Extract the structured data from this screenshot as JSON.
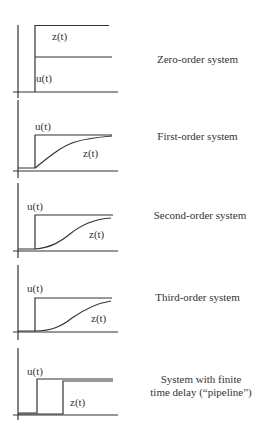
{
  "figure": {
    "panels": [
      {
        "id": "zero-order",
        "title": "Zero-order system",
        "u_label": "u(t)",
        "z_label": "z(t)"
      },
      {
        "id": "first-order",
        "title": "First-order system",
        "u_label": "u(t)",
        "z_label": "z(t)"
      },
      {
        "id": "second-order",
        "title": "Second-order system",
        "u_label": "u(t)",
        "z_label": "z(t)"
      },
      {
        "id": "third-order",
        "title": "Third-order system",
        "u_label": "u(t)",
        "z_label": "z(t)"
      },
      {
        "id": "pipeline",
        "title_line1": "System with finite",
        "title_line2": "time delay (“pipeline”)",
        "u_label": "u(t)",
        "z_label": "z(t)"
      }
    ],
    "colors": {
      "line": "#333333",
      "axis": "#444444",
      "text": "#333333"
    }
  }
}
